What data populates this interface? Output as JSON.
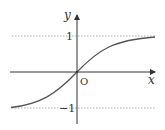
{
  "diagram": {
    "type": "function-graph",
    "function": "tanh-like sigmoid",
    "axes": {
      "x_label": "x",
      "y_label": "y",
      "origin_label": "O"
    },
    "asymptotes": [
      {
        "y": 1,
        "label": "1",
        "style": "dotted"
      },
      {
        "y": -1,
        "label": "−1",
        "style": "dotted"
      }
    ],
    "colors": {
      "axis": "#333333",
      "curve": "#555555",
      "asymptote": "#999999"
    }
  }
}
